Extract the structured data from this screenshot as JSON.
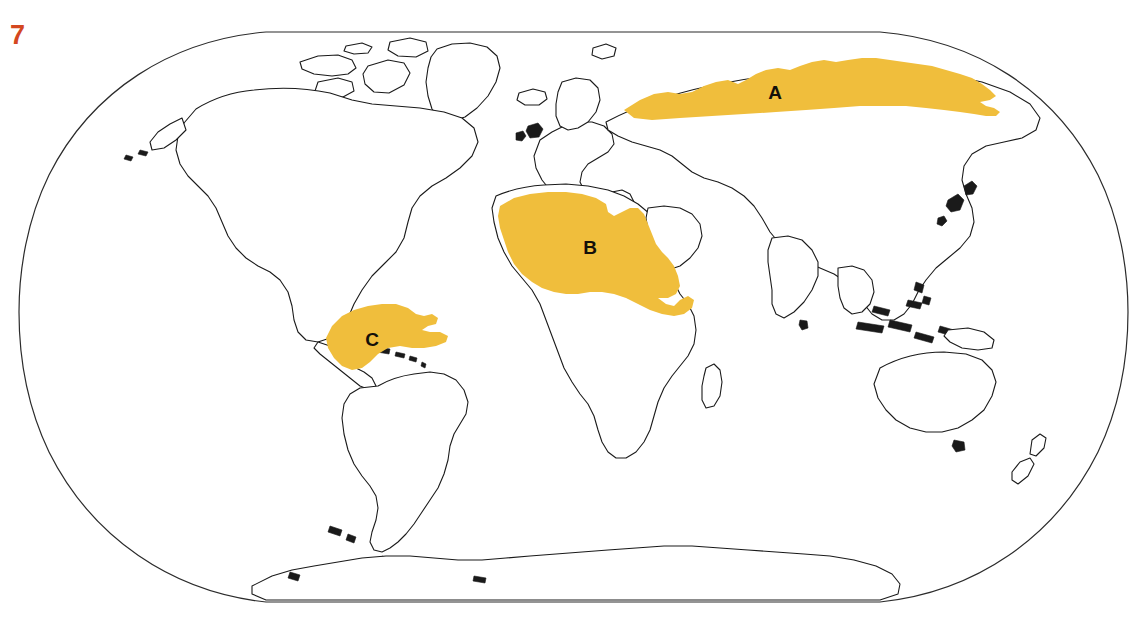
{
  "page": {
    "number": "7",
    "number_color": "#d4471f",
    "background_color": "#ffffff"
  },
  "map": {
    "projection": "robinson-style world map",
    "outline_color": "#1a1a1a",
    "frame_color": "#2b2b2b",
    "land_fill": "#ffffff",
    "highlight_color": "#f0be3c",
    "regions": [
      {
        "id": "A",
        "label": "A",
        "label_color": "#14100a",
        "area": "northern-siberia-arctic-band",
        "fill": "#f0be3c"
      },
      {
        "id": "B",
        "label": "B",
        "label_color": "#14100a",
        "area": "north-africa-sahara-horn-of-africa",
        "fill": "#f0be3c"
      },
      {
        "id": "C",
        "label": "C",
        "label_color": "#14100a",
        "area": "amazon-basin-south-america",
        "fill": "#f0be3c"
      }
    ]
  }
}
